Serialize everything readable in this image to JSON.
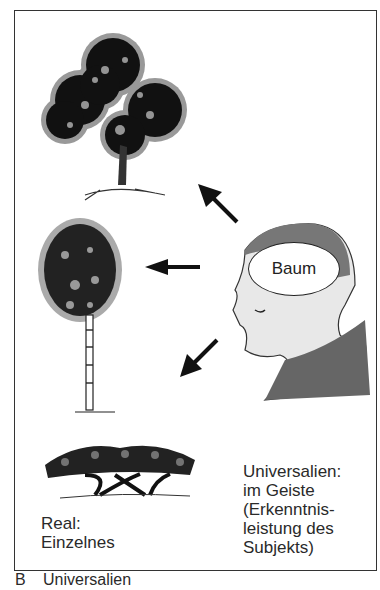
{
  "figure": {
    "caption_letter": "B",
    "caption_title": "Universalien",
    "thought_bubble": "Baum",
    "left_label": [
      "Real:",
      "Einzelnes"
    ],
    "right_label": [
      "Universalien:",
      "im Geiste",
      "(Erkenntnis-",
      "leistung des",
      "Subjekts)"
    ],
    "elements": {
      "trees": [
        "broadleaf-tree",
        "birch-tree",
        "umbrella-tree"
      ],
      "arrows": [
        "arrow-to-top-tree",
        "arrow-to-middle-tree",
        "arrow-to-bottom-tree"
      ],
      "thinker": "head-profile-with-cap"
    }
  }
}
